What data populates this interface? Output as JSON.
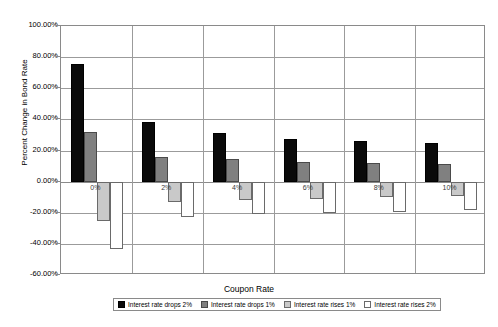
{
  "chart_data": {
    "type": "bar",
    "title": "",
    "xlabel": "Coupon Rate",
    "ylabel": "Percent Change in Bond Rate",
    "categories": [
      "0%",
      "2%",
      "4%",
      "6%",
      "8%",
      "10%"
    ],
    "ylim": [
      -60,
      100
    ],
    "ytick_labels": [
      "100.00%",
      "80.00%",
      "60.00%",
      "40.00%",
      "20.00%",
      "0.00%",
      "-20.00%",
      "-40.00%",
      "-60.00%"
    ],
    "ytick_values": [
      100,
      80,
      60,
      40,
      20,
      0,
      -20,
      -40,
      -60
    ],
    "grid": true,
    "legend_position": "bottom",
    "series": [
      {
        "name": "Interest rate drops 2%",
        "color": "#0a0a0a",
        "values": [
          75.5,
          38.5,
          31.5,
          27.5,
          26.0,
          25.0
        ]
      },
      {
        "name": "Interest rate drops 1%",
        "color": "#808080",
        "values": [
          32.0,
          16.0,
          14.5,
          12.5,
          12.0,
          11.5
        ]
      },
      {
        "name": "Interest rate rises 1%",
        "color": "#c9c9c9",
        "values": [
          -25.0,
          -13.0,
          -12.0,
          -11.0,
          -10.0,
          -9.0
        ]
      },
      {
        "name": "Interest rate rises 2%",
        "color": "#ffffff",
        "values": [
          -43.0,
          -22.5,
          -20.5,
          -20.0,
          -19.5,
          -18.5
        ]
      }
    ]
  }
}
